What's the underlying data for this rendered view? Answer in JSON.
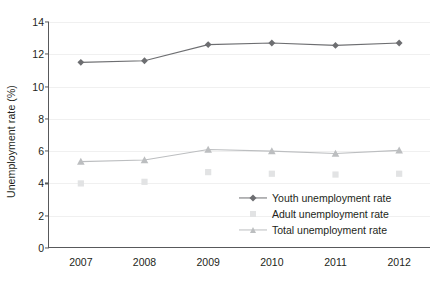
{
  "chart_data": {
    "type": "line",
    "title": "",
    "xlabel": "",
    "ylabel": "Unemployment rate (%)",
    "categories": [
      "2007",
      "2008",
      "2009",
      "2010",
      "2011",
      "2012"
    ],
    "x": [
      2007,
      2008,
      2009,
      2010,
      2011,
      2012
    ],
    "xlim": [
      2006.5,
      2012.5
    ],
    "ylim": [
      0,
      14
    ],
    "yticks": [
      0,
      2,
      4,
      6,
      8,
      10,
      12,
      14
    ],
    "grid": true,
    "legend_position": "inside-bottom-right",
    "series": [
      {
        "name": "Youth unemployment rate",
        "values": [
          11.5,
          11.6,
          12.6,
          12.7,
          12.55,
          12.7
        ],
        "color": "#6d6e71",
        "marker": "diamond",
        "line": true
      },
      {
        "name": "Adult unemployment rate",
        "values": [
          4.0,
          4.1,
          4.7,
          4.6,
          4.55,
          4.6
        ],
        "color": "#e2e3e4",
        "marker": "square",
        "line": false
      },
      {
        "name": "Total unemployment rate",
        "values": [
          5.35,
          5.45,
          6.1,
          6.0,
          5.85,
          6.05
        ],
        "color": "#bcbec0",
        "marker": "triangle",
        "line": true
      }
    ]
  }
}
